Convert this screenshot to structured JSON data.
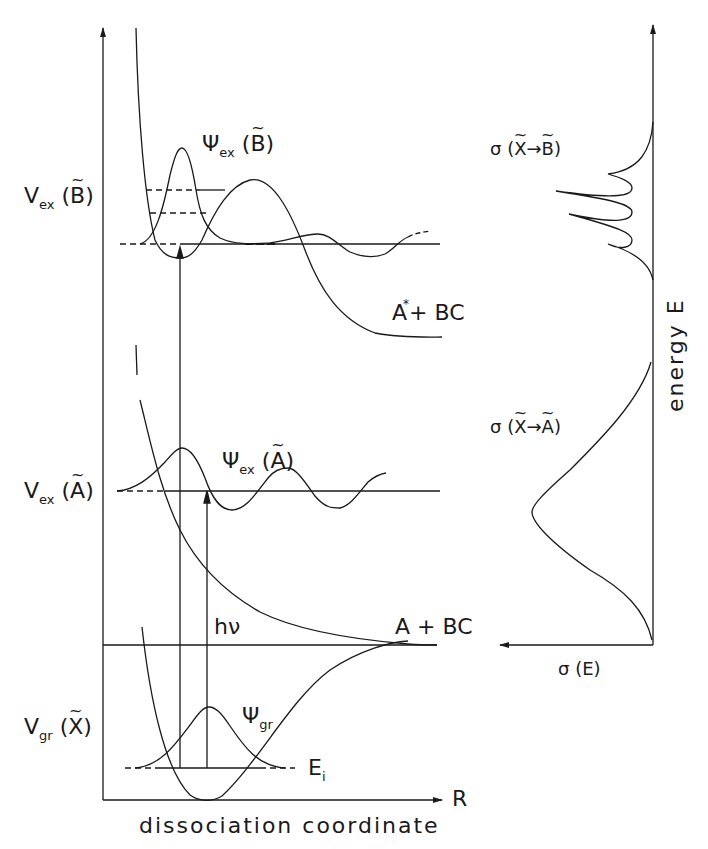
{
  "figure": {
    "left_panel": {
      "x_axis_label": "dissociation coordinate",
      "x_axis_symbol": "R",
      "states": [
        {
          "potential_label": "V",
          "potential_sub": "ex",
          "state": "B",
          "wavefunction_label": "Ψ",
          "wavefunction_sub": "ex",
          "asymptote": "A* + BC"
        },
        {
          "potential_label": "V",
          "potential_sub": "ex",
          "state": "A",
          "wavefunction_label": "Ψ",
          "wavefunction_sub": "ex",
          "asymptote": "A + BC"
        },
        {
          "potential_label": "V",
          "potential_sub": "gr",
          "state": "X",
          "wavefunction_label": "Ψ",
          "wavefunction_sub": "gr",
          "level_label": "E",
          "level_sub": "i"
        }
      ],
      "photon_label": "hν",
      "asymptote_A_star": "A",
      "asymptote_A_star_mark": "*",
      "asymptote_A_star_rest": "+ BC",
      "asymptote_A": "A + BC"
    },
    "right_panel": {
      "y_axis_label": "energy  E",
      "x_axis_label": "σ (E)",
      "spectra": [
        {
          "label_prefix": "σ (",
          "from": "X",
          "arrow": "→",
          "to": "B",
          "label_suffix": ")",
          "shape": "structured: 4 peaks"
        },
        {
          "label_prefix": "σ (",
          "from": "X",
          "arrow": "→",
          "to": "A",
          "label_suffix": ")",
          "shape": "broad gaussian"
        }
      ]
    }
  }
}
